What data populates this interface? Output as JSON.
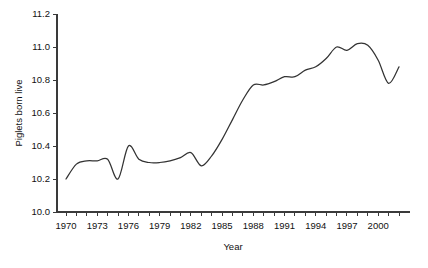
{
  "chart_data": {
    "type": "line",
    "title": "",
    "xlabel": "Year",
    "ylabel": "Piglets born live",
    "xlim": [
      1970,
      2002
    ],
    "ylim": [
      10.0,
      11.2
    ],
    "grid": false,
    "legend": null,
    "x_tick_labels": [
      "1970",
      "1973",
      "1976",
      "1979",
      "1982",
      "1985",
      "1988",
      "1991",
      "1994",
      "1997",
      "2000"
    ],
    "x_tick_values": [
      1970,
      1973,
      1976,
      1979,
      1982,
      1985,
      1988,
      1991,
      1994,
      1997,
      2000
    ],
    "x_minor_tick_values": [
      1970,
      1971,
      1972,
      1973,
      1974,
      1975,
      1976,
      1977,
      1978,
      1979,
      1980,
      1981,
      1982,
      1983,
      1984,
      1985,
      1986,
      1987,
      1988,
      1989,
      1990,
      1991,
      1992,
      1993,
      1994,
      1995,
      1996,
      1997,
      1998,
      1999,
      2000,
      2001,
      2002
    ],
    "y_tick_labels": [
      "10.0",
      "10.2",
      "10.4",
      "10.6",
      "10.8",
      "11.0",
      "11.2"
    ],
    "y_tick_values": [
      10.0,
      10.2,
      10.4,
      10.6,
      10.8,
      11.0,
      11.2
    ],
    "line_color": "#333333",
    "x": [
      1970,
      1971,
      1972,
      1973,
      1974,
      1975,
      1976,
      1977,
      1978,
      1979,
      1980,
      1981,
      1982,
      1983,
      1984,
      1985,
      1986,
      1987,
      1988,
      1989,
      1990,
      1991,
      1992,
      1993,
      1994,
      1995,
      1996,
      1997,
      1998,
      1999,
      2000,
      2001,
      2002
    ],
    "values": [
      10.2,
      10.29,
      10.31,
      10.31,
      10.32,
      10.2,
      10.4,
      10.32,
      10.3,
      10.3,
      10.31,
      10.33,
      10.36,
      10.28,
      10.34,
      10.44,
      10.56,
      10.68,
      10.77,
      10.77,
      10.79,
      10.82,
      10.82,
      10.86,
      10.88,
      10.93,
      11.0,
      10.98,
      11.02,
      11.01,
      10.92,
      10.78,
      10.88
    ]
  }
}
